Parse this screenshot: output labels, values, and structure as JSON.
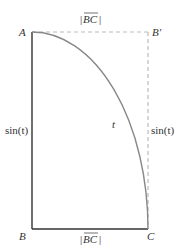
{
  "diagram": {
    "type": "geometry",
    "points": {
      "A": {
        "label": "A"
      },
      "B": {
        "label": "B"
      },
      "B_prime": {
        "label": "B'"
      },
      "C": {
        "label": "C"
      }
    },
    "labels": {
      "top_edge": "|BC|",
      "bottom_edge": "|BC|",
      "left_edge": "sin(t)",
      "right_edge": "sin(t)",
      "arc": "t",
      "bc_letters": "BC"
    },
    "colors": {
      "solid_line": "#333333",
      "dashed_line": "#bbbbbb",
      "arc": "#888888",
      "text": "#333333"
    }
  }
}
